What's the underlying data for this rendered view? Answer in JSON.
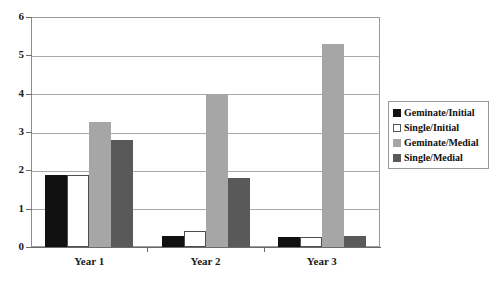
{
  "chart_data": {
    "type": "bar",
    "title": "",
    "xlabel": "",
    "ylabel": "",
    "ylim": [
      0,
      6
    ],
    "yticks": [
      "0",
      "1",
      "2",
      "3",
      "4",
      "5",
      "6"
    ],
    "grid": true,
    "legend_position": "right",
    "categories": [
      "Year 1",
      "Year 2",
      "Year 3"
    ],
    "series": [
      {
        "name": "Geminate/Initial",
        "color": "#111111",
        "values": [
          1.88,
          0.3,
          0.27
        ]
      },
      {
        "name": "Single/Initial",
        "color": "#ffffff",
        "values": [
          1.88,
          0.42,
          0.27
        ]
      },
      {
        "name": "Geminate/Medial",
        "color": "#a6a6a6",
        "values": [
          3.25,
          4.0,
          5.3
        ]
      },
      {
        "name": "Single/Medial",
        "color": "#595959",
        "values": [
          2.8,
          1.8,
          0.28
        ]
      }
    ]
  }
}
